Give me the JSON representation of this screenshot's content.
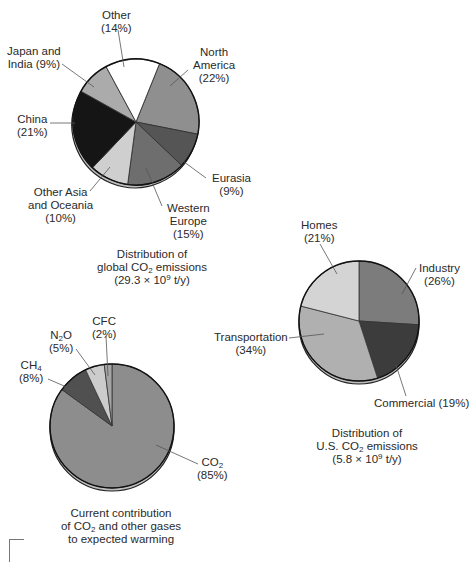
{
  "chart_data": [
    {
      "type": "pie",
      "title": "Distribution of global CO2 emissions (29.3 × 10^9 t/y)",
      "caption_lines": [
        "Distribution of",
        "global CO",
        "2",
        " emissions",
        "(29.3 × 10",
        "9",
        " t/y)"
      ],
      "categories": [
        "North America",
        "Eurasia",
        "Western Europe",
        "Other Asia and Oceania",
        "China",
        "Japan and India",
        "Other"
      ],
      "values": [
        22,
        9,
        15,
        10,
        21,
        9,
        14
      ],
      "labels": [
        "North America (22%)",
        "Eurasia (9%)",
        "Western Europe (15%)",
        "Other Asia and Oceania (10%)",
        "China (21%)",
        "Japan and India (9%)",
        "Other (14%)"
      ],
      "colors": [
        "#8f8f8f",
        "#555555",
        "#6e6e6e",
        "#cfcfcf",
        "#151515",
        "#ababab",
        "#ffffff"
      ],
      "start_angle_deg": 0,
      "unit": "%"
    },
    {
      "type": "pie",
      "title": "Distribution of U.S. CO2 emissions (5.8 × 10^9 t/y)",
      "categories": [
        "Industry",
        "Commercial",
        "Transportation",
        "Homes"
      ],
      "values": [
        26,
        19,
        34,
        21
      ],
      "labels": [
        "Industry (26%)",
        "Commercial (19%)",
        "Transportation (34%)",
        "Homes (21%)"
      ],
      "colors": [
        "#7c7c7c",
        "#3c3c3c",
        "#b0b0b0",
        "#d4d4d4"
      ],
      "start_angle_deg": 0,
      "unit": "%"
    },
    {
      "type": "pie",
      "title": "Current contribution of CO2 and other gases to expected warming",
      "categories": [
        "CO2",
        "CH4",
        "N2O",
        "CFC"
      ],
      "values": [
        85,
        8,
        5,
        2
      ],
      "labels": [
        "CO2 (85%)",
        "CH4 (8%)",
        "N2O (5%)",
        "CFC (2%)"
      ],
      "colors": [
        "#8d8d8d",
        "#505050",
        "#cccccc",
        "#a5a5a5"
      ],
      "start_angle_deg": 0,
      "unit": "%"
    }
  ],
  "global": {
    "labels": {
      "other": [
        "Other",
        "(14%)"
      ],
      "japan_india": [
        "Japan and",
        "India (9%)"
      ],
      "north_america": [
        "North",
        "America",
        "(22%)"
      ],
      "china": [
        "China",
        "(21%)"
      ],
      "eurasia": [
        "Eurasia",
        "(9%)"
      ],
      "other_asia": [
        "Other Asia",
        "and Oceania",
        "(10%)"
      ],
      "western_europe": [
        "Western",
        "Europe",
        "(15%)"
      ]
    },
    "caption": {
      "line1": "Distribution of",
      "line2_a": "global CO",
      "line2_sub": "2",
      "line2_b": " emissions",
      "line3_a": "(29.3 × 10",
      "line3_sup": "9",
      "line3_b": " t/y)"
    }
  },
  "us": {
    "labels": {
      "homes": [
        "Homes",
        "(21%)"
      ],
      "industry": [
        "Industry",
        "(26%)"
      ],
      "transportation": [
        "Transportation",
        "(34%)"
      ],
      "commercial": "Commercial (19%)"
    },
    "caption": {
      "line1": "Distribution of",
      "line2_a": "U.S. CO",
      "line2_sub": "2",
      "line2_b": " emissions",
      "line3_a": "(5.8 × 10",
      "line3_sup": "9",
      "line3_b": " t/y)"
    }
  },
  "gases": {
    "labels": {
      "cfc": [
        "CFC",
        "(2%)"
      ],
      "n2o_a": "N",
      "n2o_sub": "2",
      "n2o_b": "O",
      "n2o_pct": "(5%)",
      "ch4_a": "CH",
      "ch4_sub": "4",
      "ch4_pct": "(8%)",
      "co2_a": "CO",
      "co2_sub": "2",
      "co2_pct": "(85%)"
    },
    "caption": {
      "line1": "Current contribution",
      "line2_a": "of CO",
      "line2_sub": "2",
      "line2_b": " and other gases",
      "line3": "to expected warming"
    }
  }
}
